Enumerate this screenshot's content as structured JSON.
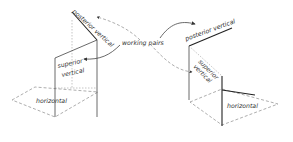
{
  "diagram": {
    "labels": {
      "posterior_vertical_left": "posterior vertical",
      "superior_vertical_left_1": "superior",
      "superior_vertical_left_2": "vertical",
      "horizontal_left": "horizontal",
      "working_pairs": "working pairs",
      "posterior_vertical_right": "posterior vertical",
      "superior_vertical_right_1": "superior",
      "superior_vertical_right_2": "vertical",
      "horizontal_right": "horizontal"
    },
    "colors": {
      "background": "#ffffff",
      "line": "#444444",
      "text": "#333333"
    }
  }
}
